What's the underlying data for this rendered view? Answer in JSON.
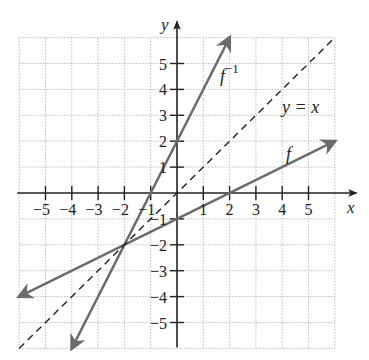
{
  "chart_data": {
    "type": "line",
    "title": "",
    "xlabel": "x",
    "ylabel": "y",
    "xlim": [
      -6,
      6
    ],
    "ylim": [
      -6,
      6
    ],
    "grid": true,
    "x_ticks": [
      -5,
      -4,
      -3,
      -2,
      -1,
      1,
      2,
      3,
      4,
      5
    ],
    "y_ticks": [
      -5,
      -4,
      -3,
      -2,
      -1,
      1,
      2,
      3,
      4,
      5
    ],
    "x_tick_labels": [
      "−5",
      "−4",
      "−3",
      "−2",
      "−1",
      "1",
      "2",
      "3",
      "4",
      "5"
    ],
    "y_tick_labels": [
      "−5",
      "−4",
      "−3",
      "−2",
      "−1",
      "1",
      "2",
      "3",
      "4",
      "5"
    ],
    "series": [
      {
        "name": "f",
        "label": "f",
        "equation": "y = x/2 - 1",
        "style": "solid-arrow-both",
        "color": "#6b6b6b",
        "x": [
          -6,
          6
        ],
        "y": [
          -4,
          2
        ]
      },
      {
        "name": "f_inverse",
        "label": "f",
        "label_superscript": "−1",
        "equation": "y = 2x + 2",
        "style": "solid-arrow-both",
        "color": "#6b6b6b",
        "x": [
          -4,
          2
        ],
        "y": [
          -6,
          6
        ]
      },
      {
        "name": "identity",
        "label": "y = x",
        "equation": "y = x",
        "style": "dashed",
        "color": "#222222",
        "x": [
          -6,
          6
        ],
        "y": [
          -6,
          6
        ]
      }
    ],
    "annotations": [
      {
        "text": "f",
        "near": [
          4.5,
          1.0
        ]
      },
      {
        "text": "f⁻¹",
        "near": [
          1.7,
          4.5
        ]
      },
      {
        "text": "y = x",
        "near": [
          3.7,
          2.9
        ]
      }
    ],
    "intersection_point": [
      -2,
      -2
    ]
  },
  "colors": {
    "axis": "#222222",
    "grid": "#bdbdbd",
    "curve": "#6b6b6b",
    "dashed": "#222222"
  }
}
